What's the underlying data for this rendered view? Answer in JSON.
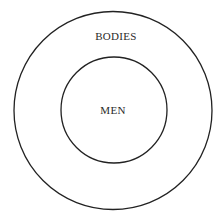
{
  "diagram": {
    "type": "nested-circles",
    "outer": {
      "label": "BODIES"
    },
    "inner": {
      "label": "MEN"
    },
    "colors": {
      "stroke": "#222222",
      "background": "#ffffff"
    }
  }
}
